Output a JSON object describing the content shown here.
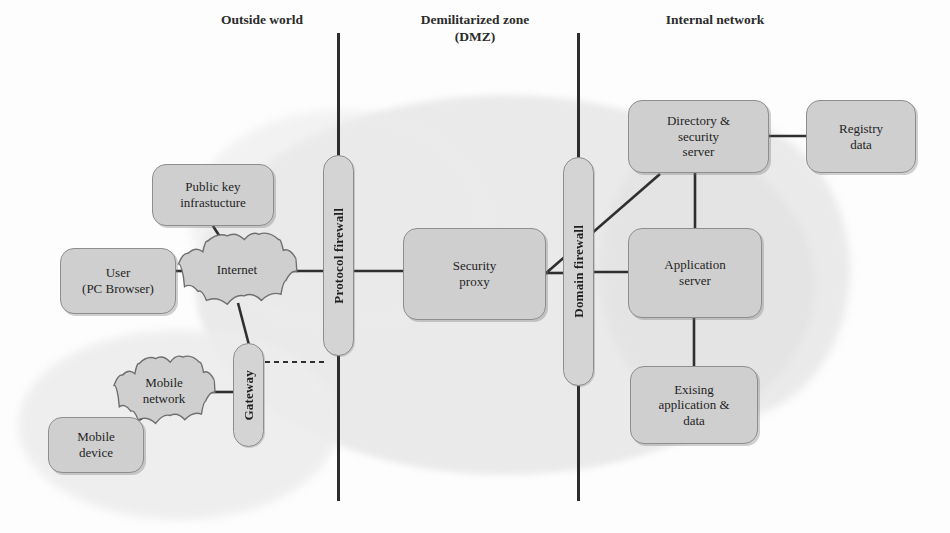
{
  "diagram": {
    "palette": {
      "node_fill": "#cfcfcf",
      "node_stroke": "#8e8e8e",
      "line": "#2f2f2f",
      "blob": "#e7e7e7",
      "text": "#1f1f1f",
      "background": "#ffffff"
    },
    "zones": [
      {
        "id": "outside",
        "label": "Outside world"
      },
      {
        "id": "dmz",
        "label": "Demilitarized zone\n(DMZ)"
      },
      {
        "id": "internal",
        "label": "Internal network"
      }
    ],
    "dividers": [
      {
        "id": "divider-outside-dmz",
        "x": 337,
        "y": 33,
        "height": 468
      },
      {
        "id": "divider-dmz-internal",
        "x": 577,
        "y": 33,
        "height": 468
      }
    ],
    "nodes": [
      {
        "id": "user",
        "shape": "rounded-box",
        "label": "User\n(PC Browser)",
        "zone": "outside",
        "x": 60,
        "y": 248,
        "w": 116,
        "h": 66
      },
      {
        "id": "public-key-infrastructure",
        "shape": "rounded-box",
        "label": "Public key\ninfrastucture",
        "zone": "outside",
        "x": 152,
        "y": 164,
        "w": 122,
        "h": 62
      },
      {
        "id": "internet",
        "shape": "cloud",
        "label": "Internet",
        "zone": "outside",
        "x": 176,
        "y": 232,
        "w": 122,
        "h": 76
      },
      {
        "id": "gateway",
        "shape": "vertical-capsule",
        "label": "Gateway",
        "zone": "outside",
        "x": 233,
        "y": 343,
        "w": 31,
        "h": 104
      },
      {
        "id": "mobile-network",
        "shape": "cloud",
        "label": "Mobile\nnetwork",
        "zone": "outside",
        "x": 112,
        "y": 355,
        "w": 104,
        "h": 72
      },
      {
        "id": "mobile-device",
        "shape": "rounded-box",
        "label": "Mobile\ndevice",
        "zone": "outside",
        "x": 48,
        "y": 417,
        "w": 96,
        "h": 56
      },
      {
        "id": "protocol-firewall",
        "shape": "vertical-capsule",
        "label": "Protocol firewall",
        "zone": "boundary",
        "x": 323,
        "y": 155,
        "w": 31,
        "h": 201
      },
      {
        "id": "security-proxy",
        "shape": "rounded-box",
        "label": "Security\nproxy",
        "zone": "dmz",
        "x": 403,
        "y": 228,
        "w": 143,
        "h": 92
      },
      {
        "id": "domain-firewall",
        "shape": "vertical-capsule",
        "label": "Domain firewall",
        "zone": "boundary",
        "x": 563,
        "y": 157,
        "w": 31,
        "h": 229
      },
      {
        "id": "directory-security-server",
        "shape": "rounded-box",
        "label": "Directory &\nsecurity\nserver",
        "zone": "internal",
        "x": 628,
        "y": 100,
        "w": 141,
        "h": 73
      },
      {
        "id": "registry-data",
        "shape": "rounded-box",
        "label": "Registry\ndata",
        "zone": "internal",
        "x": 806,
        "y": 100,
        "w": 110,
        "h": 73
      },
      {
        "id": "application-server",
        "shape": "rounded-box",
        "label": "Application\nserver",
        "zone": "internal",
        "x": 628,
        "y": 228,
        "w": 134,
        "h": 90
      },
      {
        "id": "existing-application-data",
        "shape": "rounded-box",
        "label": "Exising\napplication &\ndata",
        "zone": "internal",
        "x": 630,
        "y": 366,
        "w": 128,
        "h": 78
      }
    ],
    "links": [
      {
        "id": "user-internet",
        "from": "user",
        "to": "internet",
        "style": "solid",
        "x1": 176,
        "y1": 271,
        "x2": 196,
        "y2": 271
      },
      {
        "id": "pki-internet",
        "from": "public-key-infrastructure",
        "to": "internet",
        "style": "solid",
        "x1": 213,
        "y1": 226,
        "x2": 222,
        "y2": 240
      },
      {
        "id": "internet-protocol-fw",
        "from": "internet",
        "to": "protocol-firewall",
        "style": "solid",
        "x1": 292,
        "y1": 271,
        "x2": 325,
        "y2": 271
      },
      {
        "id": "internet-gateway",
        "from": "internet",
        "to": "gateway",
        "style": "solid",
        "x1": 238,
        "y1": 303,
        "x2": 249,
        "y2": 345
      },
      {
        "id": "gateway-protocol-fw",
        "from": "gateway",
        "to": "protocol-firewall",
        "style": "dashed",
        "x1": 265,
        "y1": 362,
        "x2": 327,
        "y2": 362
      },
      {
        "id": "mobilenet-gateway",
        "from": "mobile-network",
        "to": "gateway",
        "style": "solid",
        "x1": 209,
        "y1": 392,
        "x2": 234,
        "y2": 392
      },
      {
        "id": "mobiledevice-mobilenet",
        "from": "mobile-device",
        "to": "mobile-network",
        "style": "solid",
        "x1": 139,
        "y1": 420,
        "x2": 152,
        "y2": 412
      },
      {
        "id": "protocol-fw-proxy",
        "from": "protocol-firewall",
        "to": "security-proxy",
        "style": "solid",
        "x1": 352,
        "y1": 271,
        "x2": 405,
        "y2": 271
      },
      {
        "id": "proxy-domain-fw",
        "from": "security-proxy",
        "to": "domain-firewall",
        "style": "solid",
        "x1": 544,
        "y1": 273,
        "x2": 566,
        "y2": 273
      },
      {
        "id": "proxy-directory-diagonal",
        "from": "security-proxy",
        "to": "directory-security-server",
        "style": "solid",
        "x1": 545,
        "y1": 274,
        "x2": 660,
        "y2": 174
      },
      {
        "id": "domain-fw-appserver",
        "from": "domain-firewall",
        "to": "application-server",
        "style": "solid",
        "x1": 592,
        "y1": 272,
        "x2": 630,
        "y2": 272
      },
      {
        "id": "directory-registry",
        "from": "directory-security-server",
        "to": "registry-data",
        "style": "solid",
        "x1": 769,
        "y1": 136,
        "x2": 807,
        "y2": 136
      },
      {
        "id": "directory-appserver",
        "from": "directory-security-server",
        "to": "application-server",
        "style": "solid",
        "x1": 695,
        "y1": 173,
        "x2": 695,
        "y2": 230
      },
      {
        "id": "appserver-existing",
        "from": "application-server",
        "to": "existing-application-data",
        "style": "solid",
        "x1": 694,
        "y1": 317,
        "x2": 694,
        "y2": 368
      }
    ],
    "zone_title_positions": [
      {
        "id": "outside",
        "x": 182,
        "y": 12,
        "w": 160
      },
      {
        "id": "dmz",
        "x": 380,
        "y": 12,
        "w": 190
      },
      {
        "id": "internal",
        "x": 630,
        "y": 12,
        "w": 170
      }
    ]
  }
}
